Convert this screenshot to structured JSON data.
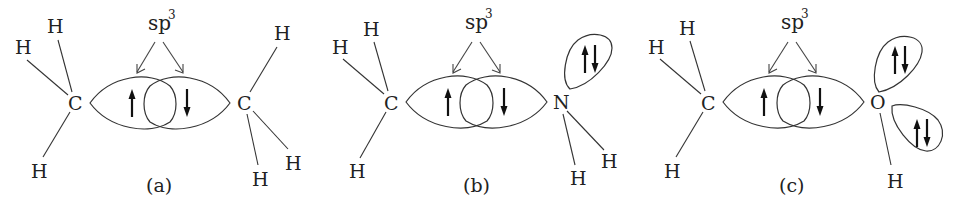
{
  "figure": {
    "hybrid_label": "sp",
    "hybrid_superscript": "3",
    "panels": [
      {
        "id": "a",
        "caption": "(a)",
        "left_atom": "C",
        "right_atom": "C",
        "left_hydrogens": [
          "H",
          "H",
          "H"
        ],
        "right_hydrogens": [
          "H",
          "H",
          "H"
        ],
        "bond_electrons": [
          "up",
          "down"
        ],
        "lone_pairs": 0
      },
      {
        "id": "b",
        "caption": "(b)",
        "left_atom": "C",
        "right_atom": "N",
        "left_hydrogens": [
          "H",
          "H",
          "H"
        ],
        "right_hydrogens": [
          "H",
          "H"
        ],
        "bond_electrons": [
          "up",
          "down"
        ],
        "lone_pairs": 1
      },
      {
        "id": "c",
        "caption": "(c)",
        "left_atom": "C",
        "right_atom": "O",
        "left_hydrogens": [
          "H",
          "H",
          "H"
        ],
        "right_hydrogens": [
          "H"
        ],
        "bond_electrons": [
          "up",
          "down"
        ],
        "lone_pairs": 2
      }
    ]
  }
}
